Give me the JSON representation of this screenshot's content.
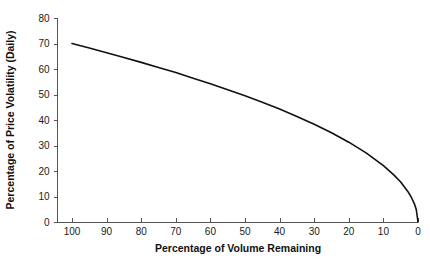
{
  "chart_data": {
    "type": "line",
    "title": "",
    "xlabel": "Percentage of Volume Remaining",
    "ylabel": "Percentage of Price Volatility (Daily)",
    "xlim": [
      100,
      0
    ],
    "ylim": [
      0,
      80
    ],
    "x_reversed": true,
    "grid": false,
    "legend": "none",
    "xticks": [
      "100",
      "90",
      "80",
      "70",
      "60",
      "50",
      "40",
      "30",
      "20",
      "10",
      "0"
    ],
    "xtick_values": [
      100,
      90,
      80,
      70,
      60,
      50,
      40,
      30,
      20,
      10,
      0
    ],
    "yticks": [
      "80",
      "70",
      "60",
      "50",
      "40",
      "30",
      "20",
      "10",
      "0"
    ],
    "ytick_values": [
      80,
      70,
      60,
      50,
      40,
      30,
      20,
      10,
      0
    ],
    "series": [
      {
        "name": "Price Volatility vs Volume Remaining",
        "color": "#111111",
        "x": [
          100,
          95,
          90,
          85,
          80,
          75,
          70,
          65,
          60,
          55,
          50,
          45,
          40,
          35,
          30,
          25,
          20,
          15,
          10,
          7,
          5,
          3,
          2,
          1,
          0.5,
          0
        ],
        "values": [
          70.0,
          68.2,
          66.4,
          64.5,
          62.6,
          60.6,
          58.6,
          56.4,
          54.2,
          51.9,
          49.5,
          47.0,
          44.3,
          41.4,
          38.3,
          35.0,
          31.3,
          27.1,
          22.1,
          18.5,
          15.7,
          12.1,
          9.9,
          7.0,
          4.9,
          0.0
        ]
      }
    ],
    "annotations": []
  },
  "axes": {
    "y_axis_title": "Percentage of Price Volatility (Daily)",
    "x_axis_title": "Percentage of Volume Remaining"
  },
  "ticks": {
    "y": [
      {
        "label": "80",
        "value": 80
      },
      {
        "label": "70",
        "value": 70
      },
      {
        "label": "60",
        "value": 60
      },
      {
        "label": "50",
        "value": 50
      },
      {
        "label": "40",
        "value": 40
      },
      {
        "label": "30",
        "value": 30
      },
      {
        "label": "20",
        "value": 20
      },
      {
        "label": "10",
        "value": 10
      },
      {
        "label": "0",
        "value": 0
      }
    ],
    "x": [
      {
        "label": "100",
        "value": 100
      },
      {
        "label": "90",
        "value": 90
      },
      {
        "label": "80",
        "value": 80
      },
      {
        "label": "70",
        "value": 70
      },
      {
        "label": "60",
        "value": 60
      },
      {
        "label": "50",
        "value": 50
      },
      {
        "label": "40",
        "value": 40
      },
      {
        "label": "30",
        "value": 30
      },
      {
        "label": "20",
        "value": 20
      },
      {
        "label": "10",
        "value": 10
      },
      {
        "label": "0",
        "value": 0
      }
    ]
  }
}
